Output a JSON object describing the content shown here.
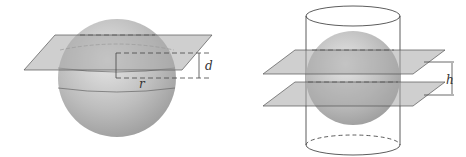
{
  "figure_left": {
    "description": "sphere cut by a plane at distance d from center, radius r",
    "labels": {
      "distance": "d",
      "radius": "r"
    }
  },
  "figure_right": {
    "description": "sphere inscribed in cylinder cut by two parallel planes separated by h",
    "labels": {
      "height": "h"
    }
  },
  "colors": {
    "sphere": "#b8b8b8",
    "plane": "#a8a8a8",
    "line": "#444444"
  }
}
